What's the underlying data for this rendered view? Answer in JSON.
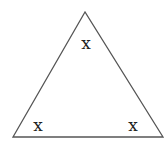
{
  "diagram": {
    "shape": "triangle",
    "stroke_color": "#555555",
    "fill_color": "#ffffff",
    "vertices": [
      {
        "name": "apex",
        "x": 85,
        "y": 12
      },
      {
        "name": "bottom-left",
        "x": 13,
        "y": 137
      },
      {
        "name": "bottom-right",
        "x": 163,
        "y": 137
      }
    ],
    "angle_labels": [
      {
        "position": "top",
        "text": "x",
        "x": 86,
        "y": 49
      },
      {
        "position": "bottom-left",
        "text": "x",
        "x": 38,
        "y": 131
      },
      {
        "position": "bottom-right",
        "text": "x",
        "x": 133,
        "y": 131
      }
    ]
  }
}
